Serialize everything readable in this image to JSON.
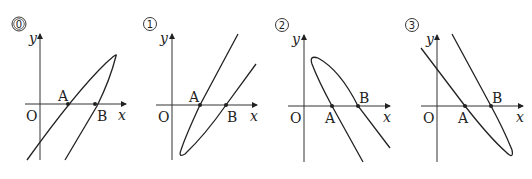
{
  "figure": {
    "panels": [
      {
        "number": "0",
        "origin_label": "O",
        "x_label": "x",
        "y_label": "y",
        "point_a": "A",
        "point_b": "B",
        "description": "Parabola opening to lower-left, tip at upper right; both branches cross x-axis going down-left"
      },
      {
        "number": "1",
        "origin_label": "O",
        "x_label": "x",
        "y_label": "y",
        "point_a": "A",
        "point_b": "B",
        "description": "Parabola with vertex at lower left, both branches going up-right through A and B"
      },
      {
        "number": "2",
        "origin_label": "O",
        "x_label": "x",
        "y_label": "y",
        "point_a": "A",
        "point_b": "B",
        "description": "Parabola with vertex at upper left, both branches going down-right through A and B"
      },
      {
        "number": "3",
        "origin_label": "O",
        "x_label": "x",
        "y_label": "y",
        "point_a": "A",
        "point_b": "B",
        "description": "Parabola with vertex at lower right, branches going up-left through A and B"
      }
    ]
  }
}
